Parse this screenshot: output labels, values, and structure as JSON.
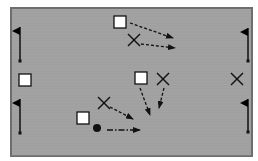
{
  "diagram": {
    "type": "sports-drill",
    "field": {
      "x": 11,
      "y": 8,
      "width": 241,
      "height": 148,
      "fill": "#a3a3a3",
      "border": "#6e6e6e"
    },
    "flags": [
      {
        "id": "flag-top-left",
        "x": 20,
        "top": 27,
        "bottom": 61,
        "side": "left"
      },
      {
        "id": "flag-bottom-left",
        "x": 20,
        "top": 99,
        "bottom": 133,
        "side": "left"
      },
      {
        "id": "flag-top-right",
        "x": 248,
        "top": 28,
        "bottom": 61,
        "side": "right"
      },
      {
        "id": "flag-bottom-right",
        "x": 248,
        "top": 99,
        "bottom": 132,
        "side": "right"
      }
    ],
    "squares": [
      {
        "id": "player-square-top",
        "x": 114,
        "y": 16,
        "size": 12
      },
      {
        "id": "player-square-left",
        "x": 19,
        "y": 74,
        "size": 12
      },
      {
        "id": "player-square-center",
        "x": 135,
        "y": 72,
        "size": 12
      },
      {
        "id": "player-square-bottom",
        "x": 77,
        "y": 112,
        "size": 12
      }
    ],
    "crosses": [
      {
        "id": "defender-x-top",
        "cx": 134,
        "cy": 40,
        "r": 6
      },
      {
        "id": "defender-x-center",
        "cx": 163,
        "cy": 79,
        "r": 6
      },
      {
        "id": "defender-x-right",
        "cx": 237,
        "cy": 79,
        "r": 6
      },
      {
        "id": "defender-x-bottom",
        "cx": 104,
        "cy": 103,
        "r": 6
      }
    ],
    "ball": {
      "cx": 97,
      "cy": 128,
      "r": 4
    },
    "arrows": [
      {
        "id": "run-arrow-1",
        "x1": 130,
        "y1": 23,
        "x2": 173,
        "y2": 38,
        "style": "dashed"
      },
      {
        "id": "run-arrow-2",
        "x1": 141,
        "y1": 44,
        "x2": 175,
        "y2": 48,
        "style": "dashed"
      },
      {
        "id": "run-arrow-3",
        "x1": 140,
        "y1": 88,
        "x2": 150,
        "y2": 115,
        "style": "dashed"
      },
      {
        "id": "run-arrow-4",
        "x1": 164,
        "y1": 88,
        "x2": 159,
        "y2": 108,
        "style": "dashed"
      },
      {
        "id": "run-arrow-5",
        "x1": 110,
        "y1": 107,
        "x2": 133,
        "y2": 119,
        "style": "dashed"
      },
      {
        "id": "pass-arrow",
        "x1": 107,
        "y1": 130,
        "x2": 140,
        "y2": 130,
        "style": "dash-dot"
      }
    ],
    "colors": {
      "ink": "#111111",
      "square_fill": "#ffffff",
      "flag": "#000000"
    }
  }
}
